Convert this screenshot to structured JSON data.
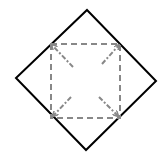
{
  "diagram": {
    "title": "",
    "colors": {
      "background": "#ffffff",
      "outer_stroke": "#000000",
      "inner_stroke": "#888888"
    },
    "outer_diamond": {
      "points": [
        [
          87,
          10
        ],
        [
          156,
          81
        ],
        [
          86,
          150
        ],
        [
          16,
          78
        ]
      ],
      "stroke_width": 2
    },
    "inner_square": {
      "x": 51,
      "y": 44,
      "width": 69,
      "height": 74,
      "dash": "6,4",
      "stroke_width": 2
    },
    "arrows": [
      {
        "name": "arrow-top-left",
        "from": [
          73,
          67
        ],
        "to": [
          52,
          45
        ]
      },
      {
        "name": "arrow-top-right",
        "from": [
          102,
          64
        ],
        "to": [
          119,
          45
        ]
      },
      {
        "name": "arrow-bottom-left",
        "from": [
          71,
          97
        ],
        "to": [
          53,
          116
        ]
      },
      {
        "name": "arrow-bottom-right",
        "from": [
          99,
          97
        ],
        "to": [
          118,
          116
        ]
      }
    ]
  }
}
